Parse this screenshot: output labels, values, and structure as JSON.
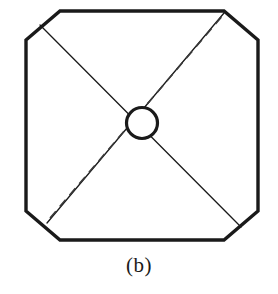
{
  "figure": {
    "caption": "(b)",
    "label": "(b)",
    "background_color": "#ffffff",
    "stroke_color": "#1a1a1a",
    "fill_color": "#ffffff"
  },
  "chart_data": {
    "type": "diagram",
    "title": "(b)",
    "canvas": {
      "width": 278,
      "height": 294
    },
    "shapes": [
      {
        "name": "octagon-frame",
        "kind": "polygon",
        "stroke": "#1a1a1a",
        "stroke_width": 3.4,
        "fill": "#ffffff",
        "points": "60,11 224,11 258,40 258,211 224,240 60,240 26,211 26,40"
      },
      {
        "name": "diagonal-anti",
        "kind": "line",
        "stroke": "#1a1a1a",
        "stroke_width": 1.3,
        "x1": 40,
        "y1": 25,
        "x2": 241,
        "y2": 227
      },
      {
        "name": "diagonal-main",
        "kind": "line",
        "stroke": "#1a1a1a",
        "stroke_width": 1.3,
        "x1": 47,
        "y1": 223,
        "x2": 224,
        "y2": 13
      },
      {
        "name": "diagonal-dashed",
        "kind": "line",
        "stroke": "#3a3a3a",
        "stroke_width": 1.6,
        "dash": "9 6",
        "x1": 50,
        "y1": 218,
        "x2": 224,
        "y2": 14
      },
      {
        "name": "center-circle",
        "kind": "circle",
        "stroke": "#1a1a1a",
        "stroke_width": 3.2,
        "fill": "#ffffff",
        "cx": 142,
        "cy": 123,
        "r": 15.5
      }
    ]
  }
}
